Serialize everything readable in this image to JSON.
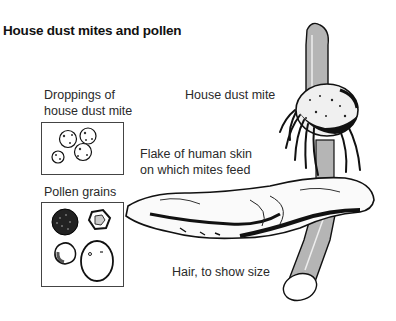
{
  "title": "House dust mites and pollen",
  "labels": {
    "droppings_line1": "Droppings of",
    "droppings_line2": "house dust mite",
    "pollen": "Pollen grains",
    "mite": "House dust mite",
    "skin_line1": "Flake of human skin",
    "skin_line2": "on which mites feed",
    "hair": "Hair, to show size"
  },
  "colors": {
    "hair_fill": "#b5b5b5",
    "ink": "#111111",
    "box_border": "#444444"
  }
}
